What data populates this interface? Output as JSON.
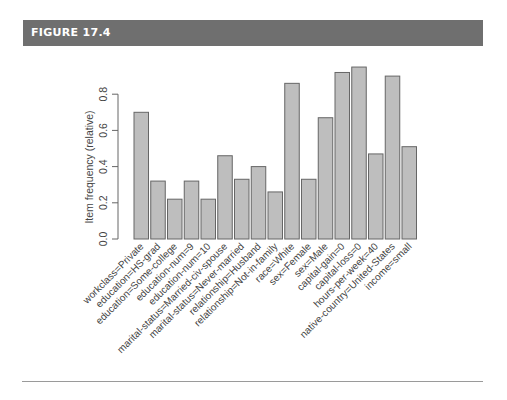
{
  "figure": {
    "title": "FIGURE 17.4"
  },
  "chart_data": {
    "type": "bar",
    "title": "",
    "xlabel": "",
    "ylabel": "Item frequency (relative)",
    "ylim": [
      0,
      0.8
    ],
    "yticks": [
      "0.0",
      "0.2",
      "0.4",
      "0.6",
      "0.8"
    ],
    "grid": false,
    "legend": null,
    "bar_color": "#bebebe",
    "bar_edge_color": "#666666",
    "categories": [
      "workclass=Private",
      "education=HS-grad",
      "education=Some-college",
      "education-num=9",
      "education-num=10",
      "marital-status=Married-civ-spouse",
      "marital-status=Never-married",
      "relationship=Husband",
      "relationship=Not-in-family",
      "race=White",
      "sex=Female",
      "sex=Male",
      "capital-gain=0",
      "capital-loss=0",
      "hours-per-week=40",
      "native-country=United-States",
      "income=small"
    ],
    "values": [
      0.7,
      0.32,
      0.22,
      0.32,
      0.22,
      0.46,
      0.33,
      0.4,
      0.26,
      0.86,
      0.33,
      0.67,
      0.92,
      0.95,
      0.47,
      0.9,
      0.51
    ]
  }
}
